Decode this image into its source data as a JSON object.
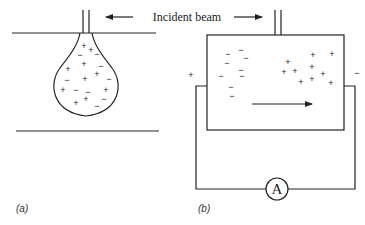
{
  "title": "Incident beam",
  "panels": [
    {
      "id": "a",
      "label": "(a)",
      "description": "Charged liquid drop forming at a tube tip between two horizontal plates",
      "charges": [
        {
          "sign": "+",
          "x": 84,
          "y": 46
        },
        {
          "sign": "+",
          "x": 91,
          "y": 50
        },
        {
          "sign": "−",
          "x": 80,
          "y": 55
        },
        {
          "sign": "−",
          "x": 97,
          "y": 54
        },
        {
          "sign": "+",
          "x": 68,
          "y": 69
        },
        {
          "sign": "+",
          "x": 84,
          "y": 64
        },
        {
          "sign": "−",
          "x": 101,
          "y": 66
        },
        {
          "sign": "−",
          "x": 67,
          "y": 80
        },
        {
          "sign": "+",
          "x": 85,
          "y": 79
        },
        {
          "sign": "+",
          "x": 97,
          "y": 74
        },
        {
          "sign": "−",
          "x": 109,
          "y": 79
        },
        {
          "sign": "+",
          "x": 63,
          "y": 90
        },
        {
          "sign": "−",
          "x": 76,
          "y": 90
        },
        {
          "sign": "−",
          "x": 88,
          "y": 92
        },
        {
          "sign": "+",
          "x": 106,
          "y": 90
        },
        {
          "sign": "+",
          "x": 76,
          "y": 103
        },
        {
          "sign": "+",
          "x": 86,
          "y": 99
        },
        {
          "sign": "−",
          "x": 104,
          "y": 99
        },
        {
          "sign": "−",
          "x": 97,
          "y": 106
        }
      ]
    },
    {
      "id": "b",
      "label": "(b)",
      "description": "Chamber with separated charges connected to an external circuit with ammeter",
      "left_terminal": "+",
      "right_terminal": "−",
      "meter_label": "A",
      "negative_charges": [
        {
          "sign": "−",
          "x": 228,
          "y": 54
        },
        {
          "sign": "−",
          "x": 241,
          "y": 50
        },
        {
          "sign": "−",
          "x": 246,
          "y": 58
        },
        {
          "sign": "−",
          "x": 227,
          "y": 63
        },
        {
          "sign": "−",
          "x": 241,
          "y": 70
        },
        {
          "sign": "−",
          "x": 221,
          "y": 76
        },
        {
          "sign": "−",
          "x": 242,
          "y": 76
        },
        {
          "sign": "−",
          "x": 231,
          "y": 87
        },
        {
          "sign": "−",
          "x": 232,
          "y": 96
        }
      ],
      "positive_charges": [
        {
          "sign": "+",
          "x": 288,
          "y": 62
        },
        {
          "sign": "+",
          "x": 284,
          "y": 72
        },
        {
          "sign": "+",
          "x": 295,
          "y": 71
        },
        {
          "sign": "+",
          "x": 313,
          "y": 55
        },
        {
          "sign": "+",
          "x": 332,
          "y": 54
        },
        {
          "sign": "+",
          "x": 312,
          "y": 67
        },
        {
          "sign": "+",
          "x": 323,
          "y": 74
        },
        {
          "sign": "+",
          "x": 301,
          "y": 82
        },
        {
          "sign": "+",
          "x": 312,
          "y": 79
        },
        {
          "sign": "+",
          "x": 331,
          "y": 83
        }
      ],
      "arrow_direction": "right"
    }
  ]
}
